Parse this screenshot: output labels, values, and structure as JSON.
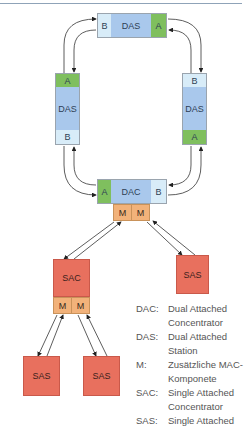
{
  "header": {
    "rule_color": "#8fa3b8"
  },
  "colors": {
    "port_a": "#7fbf5e",
    "port_b": "#d8ecf8",
    "station_core": "#a9c8ec",
    "single_attached": "#e8705e",
    "mac_component": "#f2b27a"
  },
  "ring": {
    "top_das": {
      "port_left": "B",
      "label": "DAS",
      "port_right": "A"
    },
    "left_das": {
      "port_top": "A",
      "label": "DAS",
      "port_bottom": "B"
    },
    "right_das": {
      "port_top": "B",
      "label": "DAS",
      "port_bottom": "A"
    },
    "dac": {
      "port_left": "A",
      "label": "DAC",
      "port_right": "B",
      "mac_ports": [
        "M",
        "M"
      ]
    }
  },
  "tree": {
    "sac": {
      "label": "SAC",
      "mac_ports": [
        "M",
        "M"
      ]
    },
    "sas_right": {
      "label": "SAS"
    },
    "sas_bottom_left": {
      "label": "SAS"
    },
    "sas_bottom_mid": {
      "label": "SAS"
    }
  },
  "legend": [
    {
      "key": "DAC:",
      "lines": [
        "Dual Attached",
        "Concentrator"
      ]
    },
    {
      "key": "DAS:",
      "lines": [
        "Dual Attached",
        "Station"
      ]
    },
    {
      "key": "M:",
      "lines": [
        "Zusätzliche MAC-",
        "Komponete"
      ]
    },
    {
      "key": "SAC:",
      "lines": [
        "Single Attached",
        "Concentrator"
      ]
    },
    {
      "key": "SAS:",
      "lines": [
        "Single Attached"
      ]
    }
  ]
}
